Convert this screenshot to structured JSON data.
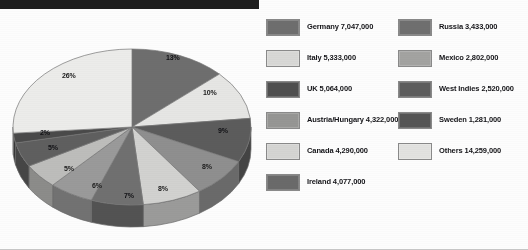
{
  "chart_data": {
    "type": "pie",
    "title": "",
    "subtitle": "",
    "xlabel": "",
    "ylabel": "",
    "legend_position": "right",
    "grid": false,
    "value_unit": "people",
    "categories": [
      "Germany",
      "Italy",
      "UK",
      "Austria/Hungary",
      "Canada",
      "Ireland",
      "Russia",
      "Mexico",
      "West Indies",
      "Sweden",
      "Others"
    ],
    "values": [
      7047000,
      5333000,
      5064000,
      4322000,
      4290000,
      4077000,
      3433000,
      2802000,
      2520000,
      1281000,
      14259000
    ],
    "value_labels": [
      "7,047,000",
      "5,333,000",
      "5,064,000",
      "4,322,000",
      "4,290,000",
      "4,077,000",
      "3,433,000",
      "2,802,000",
      "2,520,000",
      "1,281,000",
      "14,259,000"
    ],
    "percent_labels": [
      "13%",
      "10%",
      "9%",
      "8%",
      "8%",
      "7%",
      "6%",
      "5%",
      "5%",
      "2%",
      "26%"
    ],
    "percents": [
      13,
      10,
      9,
      8,
      8,
      7,
      6,
      5,
      5,
      2,
      26
    ],
    "slice_colors": [
      "#6e6e6e",
      "#e6e6e4",
      "#5c5c5c",
      "#8f8f8f",
      "#d2d2d0",
      "#707070",
      "#9a9a9a",
      "#bdbdbb",
      "#5f5f5f",
      "#4a4a4a",
      "#ececea"
    ]
  },
  "pie": {
    "labels": [
      {
        "text": "13%",
        "x": 160,
        "y": 32,
        "tone": "ondark"
      },
      {
        "text": "10%",
        "x": 197,
        "y": 67,
        "tone": "onlight"
      },
      {
        "text": "9%",
        "x": 212,
        "y": 105,
        "tone": "ondark"
      },
      {
        "text": "8%",
        "x": 196,
        "y": 141,
        "tone": "onlight"
      },
      {
        "text": "8%",
        "x": 152,
        "y": 163,
        "tone": "onlight"
      },
      {
        "text": "7%",
        "x": 118,
        "y": 170,
        "tone": "ondark"
      },
      {
        "text": "6%",
        "x": 86,
        "y": 160,
        "tone": "onlight"
      },
      {
        "text": "5%",
        "x": 58,
        "y": 143,
        "tone": "onlight"
      },
      {
        "text": "5%",
        "x": 42,
        "y": 122,
        "tone": "ondark"
      },
      {
        "text": "2%",
        "x": 34,
        "y": 107,
        "tone": "ondark"
      },
      {
        "text": "26%",
        "x": 56,
        "y": 50,
        "tone": "onlight"
      }
    ]
  },
  "legend": {
    "columns": [
      {
        "items": [
          {
            "label": "Germany 7,047,000",
            "color": "#6e6e6e"
          },
          {
            "label": "Italy 5,333,000",
            "color": "#d8d8d6"
          },
          {
            "label": "UK 5,064,000",
            "color": "#4f4f4f"
          },
          {
            "label": "Austria/Hungary 4,322,000",
            "color": "#969694"
          },
          {
            "label": "Canada 4,290,000",
            "color": "#d5d5d3"
          },
          {
            "label": "Ireland 4,077,000",
            "color": "#6a6a6a"
          }
        ]
      },
      {
        "items": [
          {
            "label": "Russia 3,433,000",
            "color": "#6f6f6f"
          },
          {
            "label": "Mexico 2,802,000",
            "color": "#a3a3a1"
          },
          {
            "label": "West Indies 2,520,000",
            "color": "#5d5d5d"
          },
          {
            "label": "Sweden 1,281,000",
            "color": "#555555"
          },
          {
            "label": "Others 14,259,000",
            "color": "#e2e2e0"
          }
        ]
      }
    ]
  }
}
